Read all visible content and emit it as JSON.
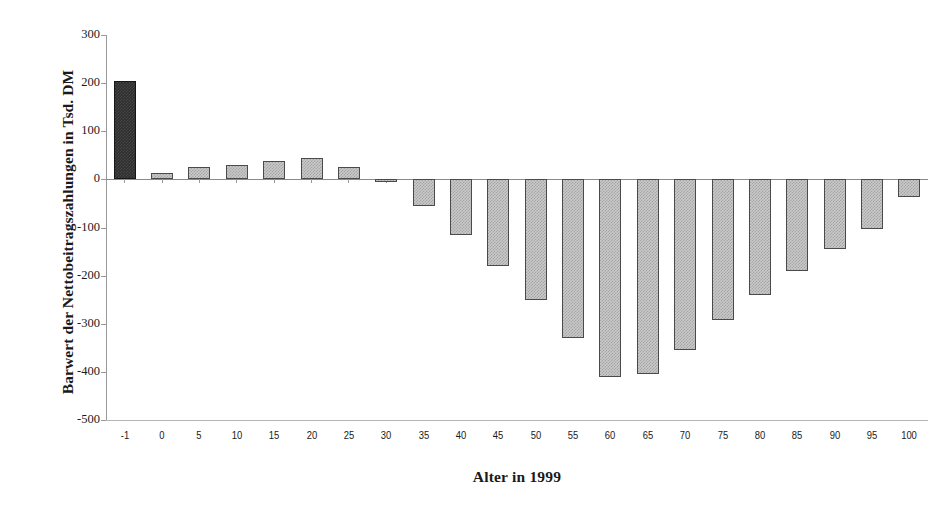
{
  "chart_data": {
    "type": "bar",
    "title": "",
    "xlabel": "Alter in 1999",
    "ylabel": "Barwert der Nettobeitragszahlungen in Tsd. DM",
    "categories": [
      "-1",
      "0",
      "5",
      "10",
      "15",
      "20",
      "25",
      "30",
      "35",
      "40",
      "45",
      "50",
      "55",
      "60",
      "65",
      "70",
      "75",
      "80",
      "85",
      "90",
      "95",
      "100"
    ],
    "values": [
      205,
      14,
      25,
      30,
      38,
      44,
      25,
      -4,
      -56,
      -116,
      -180,
      -250,
      -330,
      -410,
      -405,
      -355,
      -293,
      -240,
      -190,
      -145,
      -103,
      -37
    ],
    "ylim": [
      -500,
      300
    ],
    "yticks": [
      300,
      200,
      100,
      0,
      -100,
      -200,
      -300,
      -400,
      -500
    ],
    "ytick_labels": [
      "300",
      "200",
      "100",
      "0",
      "-100",
      "-200",
      "-300",
      "-400",
      "-500"
    ],
    "grid": false,
    "legend": false,
    "highlight_index": 0,
    "colors": {
      "bar_fill": "#c9c9c9",
      "bar_border": "#4a4a4a",
      "highlight_fill": "#2e2e2e",
      "highlight_border": "#161616",
      "axis": "#9a9a9a",
      "text": "#1a1a1a",
      "background": "#ffffff"
    }
  },
  "figure": {
    "x_axis_title": "Alter in 1999",
    "y_axis_title": "Barwert der Nettobeitragszahlungen in Tsd. DM"
  }
}
